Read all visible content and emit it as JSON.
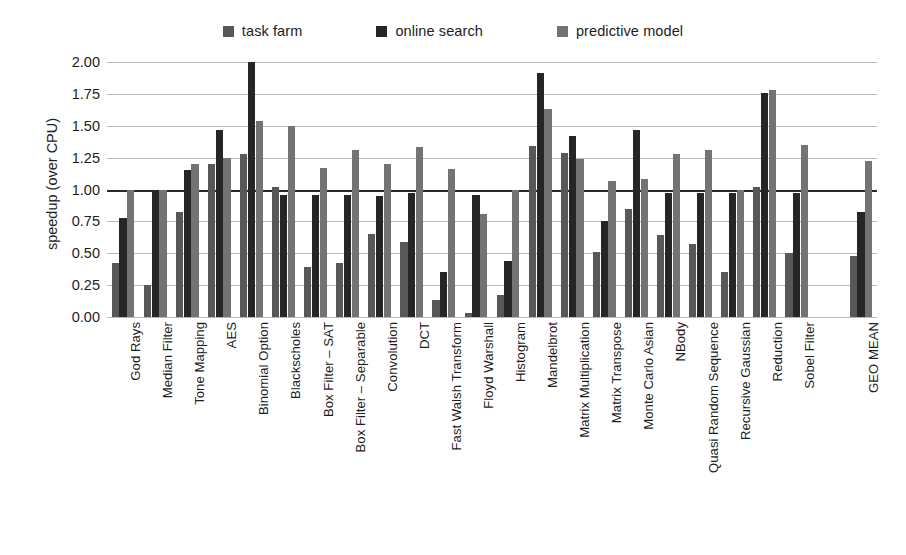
{
  "legend": {
    "items": [
      {
        "label": "task farm",
        "color": "#585858",
        "name": "legend-task-farm"
      },
      {
        "label": "online search",
        "color": "#262626",
        "name": "legend-online-search"
      },
      {
        "label": "predictive model",
        "color": "#737373",
        "name": "legend-predictive-model"
      }
    ]
  },
  "axes": {
    "ylabel": "speedup (over CPU)",
    "yticks": [
      "2.00",
      "1.75",
      "1.50",
      "1.25",
      "1.00",
      "0.75",
      "0.50",
      "0.25",
      "0.00"
    ]
  },
  "chart_data": {
    "type": "bar",
    "title": "",
    "xlabel": "",
    "ylabel": "speedup (over CPU)",
    "ylim": [
      0.0,
      2.0
    ],
    "ytick_step": 0.25,
    "grid": true,
    "reference_line": 1.0,
    "legend_position": "top-center",
    "categories": [
      "God Rays",
      "Median Filter",
      "Tone Mapping",
      "AES",
      "Binomial Option",
      "Blackscholes",
      "Box Filter – SAT",
      "Box Filter – Separable",
      "Convolution",
      "DCT",
      "Fast Walsh Transform",
      "Floyd Warshall",
      "Histogram",
      "Mandelbrot",
      "Matrix Multiplication",
      "Matrix Transpose",
      "Monte Carlo Asian",
      "NBody",
      "Quasi Random Sequence",
      "Recursive Gaussian",
      "Reduction",
      "Sobel Filter",
      "",
      "GEO MEAN"
    ],
    "series": [
      {
        "name": "task farm",
        "color": "#585858",
        "values": [
          0.42,
          0.25,
          0.82,
          1.2,
          1.28,
          1.02,
          0.39,
          0.42,
          0.65,
          0.59,
          0.13,
          0.03,
          0.17,
          1.34,
          1.29,
          0.51,
          0.85,
          0.64,
          0.57,
          0.35,
          1.02,
          0.5,
          null,
          0.48
        ]
      },
      {
        "name": "online search",
        "color": "#262626",
        "values": [
          0.78,
          1.0,
          1.15,
          1.47,
          2.0,
          0.96,
          0.96,
          0.96,
          0.95,
          0.97,
          0.35,
          0.96,
          0.44,
          1.91,
          1.42,
          0.75,
          1.47,
          0.97,
          0.97,
          0.97,
          1.76,
          0.97,
          null,
          0.82
        ]
      },
      {
        "name": "predictive model",
        "color": "#737373",
        "values": [
          1.0,
          1.0,
          1.2,
          1.25,
          1.54,
          1.5,
          1.17,
          1.31,
          1.2,
          1.33,
          1.16,
          0.81,
          1.0,
          1.63,
          1.24,
          1.07,
          1.08,
          1.28,
          1.31,
          1.0,
          1.78,
          1.35,
          null,
          1.22
        ]
      }
    ]
  }
}
